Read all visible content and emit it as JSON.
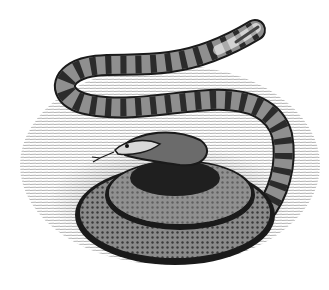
{
  "image": {
    "subject": "Pen-and-ink illustration of a coiled banded snake on hatched ground",
    "style": "black and white cross-hatched drawing",
    "colors": {
      "background": "#ffffff",
      "ink": "#1a1a1a",
      "mid_tone": "#6b6b6b",
      "light_band": "#d9d9d9"
    }
  }
}
